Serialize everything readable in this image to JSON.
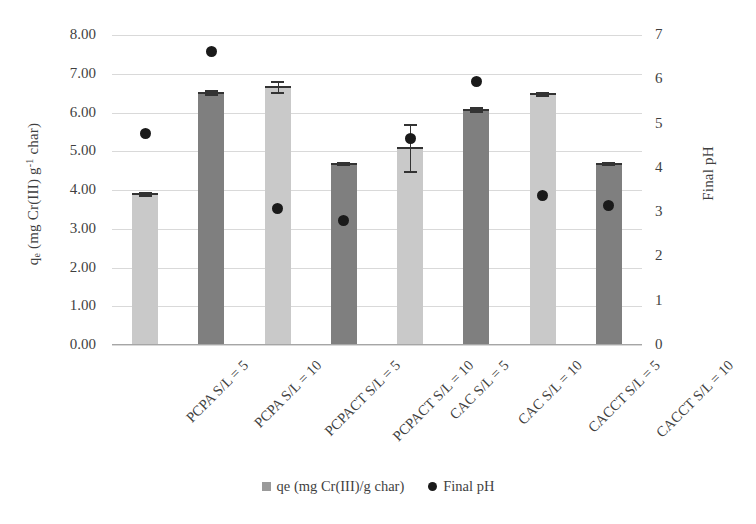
{
  "chart_data": {
    "type": "bar",
    "title": "",
    "categories": [
      "PCPA S/L = 5",
      "PCPA S/L = 10",
      "PCPACT S/L = 5",
      "PCPACT S/L = 10",
      "CAC S/L = 5",
      "CAC S/L = 10",
      "CACCT S/L = 5",
      "CACCT S/L = 10"
    ],
    "series": [
      {
        "name": "qe (mg Cr(III)/g char)",
        "type": "bar",
        "axis": "left",
        "color": "#c9c9c9",
        "alt_color": "#7f7f7f",
        "values": [
          3.92,
          6.53,
          6.68,
          4.7,
          5.1,
          6.1,
          6.5,
          4.7
        ],
        "errors": [
          0.04,
          0.04,
          0.14,
          0.03,
          0.6,
          0.05,
          0.04,
          0.03
        ],
        "bar_shades": [
          "light",
          "dark",
          "light",
          "dark",
          "light",
          "dark",
          "light",
          "dark"
        ]
      },
      {
        "name": "Final pH",
        "type": "scatter",
        "axis": "right",
        "color": "#1a1a1a",
        "values": [
          4.77,
          6.62,
          3.08,
          2.82,
          4.66,
          5.94,
          3.38,
          3.15
        ]
      }
    ],
    "xlabel": "",
    "ylabel_left": "qe (mg Cr(III) g-1 char)",
    "ylabel_right": "Final pH",
    "ylim_left": [
      0.0,
      8.0
    ],
    "ylim_right": [
      0,
      7
    ],
    "yticks_left": [
      "0.00",
      "1.00",
      "2.00",
      "3.00",
      "4.00",
      "5.00",
      "6.00",
      "7.00",
      "8.00"
    ],
    "yticks_right": [
      "0",
      "1",
      "2",
      "3",
      "4",
      "5",
      "6",
      "7"
    ],
    "grid": true,
    "legend_position": "bottom"
  },
  "axes": {
    "left_title_parts": {
      "lead": "q",
      "sub": "e",
      "mid": " (mg Cr(III) g",
      "sup": "-1",
      "tail": " char)"
    },
    "right_title": "Final pH"
  },
  "legend": {
    "items": [
      {
        "label": "qe (mg Cr(III)/g char)",
        "marker": "square-marker-icon",
        "color": "#9a9a9a"
      },
      {
        "label": "Final pH",
        "marker": "dot-marker-icon",
        "color": "#1a1a1a"
      }
    ]
  }
}
